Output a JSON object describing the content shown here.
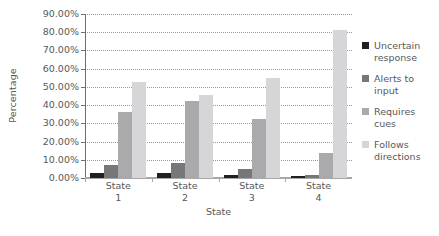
{
  "chart_data": {
    "type": "bar",
    "title": "",
    "xlabel": "State",
    "ylabel": "Percentage",
    "categories": [
      "State 1",
      "State 2",
      "State 3",
      "State 4"
    ],
    "category_lines": [
      [
        "State",
        "1"
      ],
      [
        "State",
        "2"
      ],
      [
        "State",
        "3"
      ],
      [
        "State",
        "4"
      ]
    ],
    "ylim": [
      0,
      90
    ],
    "ytick_step": 10,
    "ytick_labels": [
      "0.00%",
      "10.00%",
      "20.00%",
      "30.00%",
      "40.00%",
      "50.00%",
      "60.00%",
      "70.00%",
      "80.00%",
      "90.00%"
    ],
    "ytick_values": [
      0,
      10,
      20,
      30,
      40,
      50,
      60,
      70,
      80,
      90
    ],
    "grid": true,
    "legend_position": "right",
    "series": [
      {
        "name": "Uncertain response",
        "name_lines": [
          "Uncertain",
          "response"
        ],
        "color": "#231f20",
        "values": [
          2.5,
          3.0,
          1.5,
          1.0
        ]
      },
      {
        "name": "Alerts to input",
        "name_lines": [
          "Alerts to",
          "input"
        ],
        "color": "#77777a",
        "values": [
          7.0,
          8.5,
          5.0,
          1.5
        ]
      },
      {
        "name": "Requires cues",
        "name_lines": [
          "Requires",
          "cues"
        ],
        "color": "#aaaaad",
        "values": [
          36.5,
          42.0,
          32.5,
          13.5
        ]
      },
      {
        "name": "Follows directions",
        "name_lines": [
          "Follows",
          "directions"
        ],
        "color": "#d6d6d8",
        "values": [
          52.5,
          45.5,
          55.0,
          81.0
        ]
      }
    ]
  }
}
